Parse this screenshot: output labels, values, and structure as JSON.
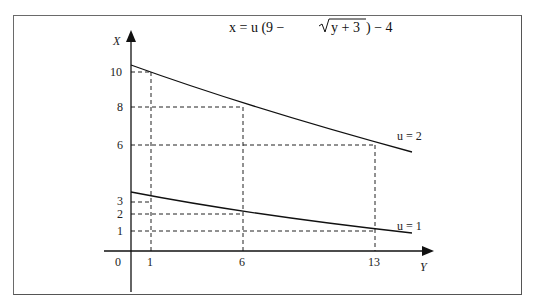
{
  "title": {
    "prefix": "x = u (9 − ",
    "sqrt_arg": "y + 3",
    "suffix": ") − 4"
  },
  "axes": {
    "x_label": "Y",
    "y_label": "X",
    "origin_label": "0"
  },
  "x_ticks": [
    {
      "label": "1",
      "value": 1
    },
    {
      "label": "6",
      "value": 6
    },
    {
      "label": "13",
      "value": 13
    }
  ],
  "y_ticks": [
    {
      "label": "10",
      "value": 10
    },
    {
      "label": "8",
      "value": 8
    },
    {
      "label": "6",
      "value": 6
    },
    {
      "label": "3",
      "value": 3
    },
    {
      "label": "2",
      "value": 2
    },
    {
      "label": "1",
      "value": 1
    }
  ],
  "curves": [
    {
      "label": "u = 2",
      "u": 2
    },
    {
      "label": "u = 1",
      "u": 1
    }
  ],
  "colors": {
    "line": "#1a1a1a",
    "frame": "#666666"
  }
}
